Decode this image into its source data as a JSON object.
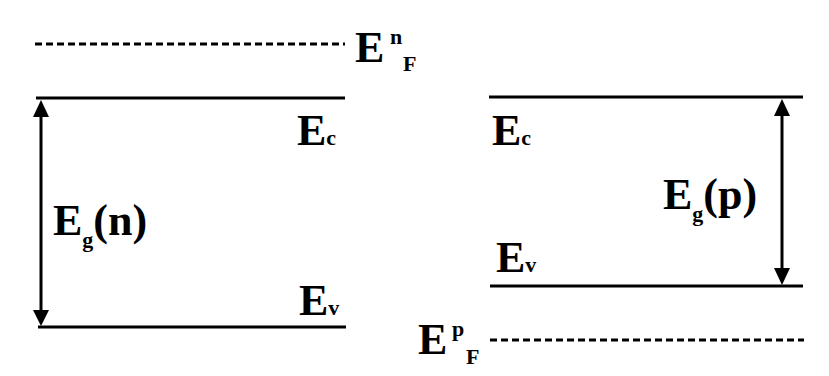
{
  "diagram": {
    "title": "",
    "n_side": {
      "fermi_level": {
        "base": "E",
        "sup": "n",
        "sub": "F"
      },
      "conduction_band": {
        "base": "E",
        "sub": "c"
      },
      "valence_band": {
        "base": "E",
        "sub": "v"
      },
      "band_gap": {
        "base": "E",
        "sub": "g",
        "suffix": "(n)"
      }
    },
    "p_side": {
      "fermi_level": {
        "base": "E",
        "sup": "p",
        "sub": "F"
      },
      "conduction_band": {
        "base": "E",
        "sub": "c"
      },
      "valence_band": {
        "base": "E",
        "sub": "v"
      },
      "band_gap": {
        "base": "E",
        "sub": "g",
        "suffix": "(p)"
      }
    },
    "line_color": "#000000",
    "background": "#ffffff"
  }
}
